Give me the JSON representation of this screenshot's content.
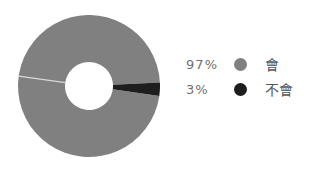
{
  "figure": {
    "background_color": "#ffffff",
    "width": 319,
    "height": 170
  },
  "chart_data": {
    "type": "pie",
    "variant": "donut",
    "title": "",
    "subtitle": "",
    "xlabel": "",
    "ylabel": "",
    "grid": false,
    "legend_position": "right",
    "hole_ratio": 0.34,
    "start_angle_deg": 8,
    "direction": "clockwise",
    "labels": [
      "會",
      "不會"
    ],
    "values": [
      97,
      3
    ],
    "value_labels": [
      "97%",
      "3%"
    ],
    "colors": [
      "#808080",
      "#1e1e1e"
    ],
    "slices": [
      {
        "label": "會",
        "value": 97,
        "value_label": "97%",
        "color": "#808080",
        "sweep_deg": 349.2
      },
      {
        "label": "不會",
        "value": 3,
        "value_label": "3%",
        "color": "#1e1e1e",
        "sweep_deg": 10.8
      }
    ]
  },
  "donut": {
    "center_x": 71,
    "center_y": 71,
    "outer_radius": 71,
    "inner_radius": 24,
    "hole_color": "#ffffff",
    "separator_color": "#d9d9d9"
  },
  "legend": {
    "rows": [
      {
        "percent": "97%",
        "label": "會",
        "swatch_color": "#808080",
        "swatch_name": "legend-swatch-gray"
      },
      {
        "percent": "3%",
        "label": "不會",
        "swatch_color": "#1e1e1e",
        "swatch_name": "legend-swatch-black"
      }
    ],
    "percent_color": "#6f6f6f",
    "label_color": "#565656"
  }
}
